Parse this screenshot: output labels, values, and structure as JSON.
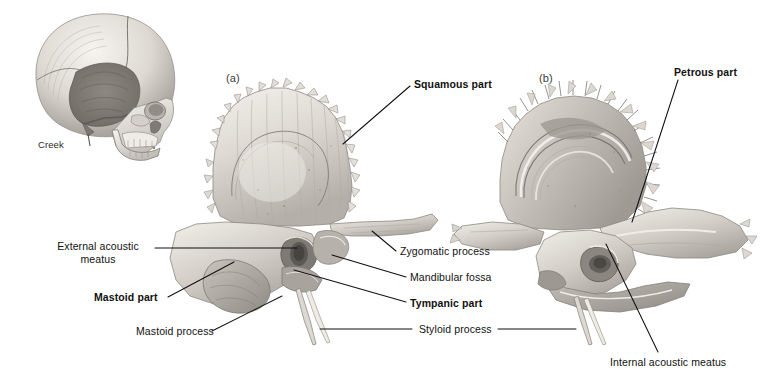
{
  "figure": {
    "kind": "anatomical-illustration",
    "background_color": "#ffffff",
    "ink_color": "#111111",
    "signature": "Creek"
  },
  "panels": [
    {
      "id": "a",
      "label": "(a)",
      "view": "lateral view of right temporal bone",
      "x": 232,
      "y": 74
    },
    {
      "id": "b",
      "label": "(b)",
      "view": "medial view of right temporal bone",
      "x": 545,
      "y": 74
    }
  ],
  "inset": {
    "name": "lateral skull orientation",
    "signature": "Creek",
    "signature_x": 38,
    "signature_y": 139
  },
  "labels": [
    {
      "id": "squamous-part",
      "text": "Squamous part",
      "bold": true,
      "x": 414,
      "y": 78,
      "align": "left",
      "lines": [
        [
          410,
          86,
          343,
          144
        ]
      ]
    },
    {
      "id": "petrous-part",
      "text": "Petrous part",
      "bold": true,
      "x": 674,
      "y": 66,
      "align": "left",
      "lines": [
        [
          678,
          80,
          632,
          222
        ]
      ]
    },
    {
      "id": "external-acoustic-meatus",
      "text": "External acoustic\nmeatus",
      "bold": false,
      "x": 46,
      "y": 240,
      "align": "left",
      "lines": [
        [
          155,
          248,
          297,
          248
        ]
      ]
    },
    {
      "id": "mastoid-part",
      "text": "Mastoid part",
      "bold": true,
      "x": 94,
      "y": 293,
      "align": "left",
      "lines": [
        [
          168,
          297,
          232,
          262
        ]
      ]
    },
    {
      "id": "mastoid-process",
      "text": "Mastoid process",
      "bold": false,
      "x": 136,
      "y": 330,
      "align": "left",
      "lines": [
        [
          210,
          331,
          280,
          296
        ]
      ]
    },
    {
      "id": "zygomatic-process",
      "text": "Zygomatic process",
      "bold": false,
      "x": 400,
      "y": 247,
      "align": "left",
      "lines": [
        [
          396,
          251,
          372,
          232
        ]
      ]
    },
    {
      "id": "mandibular-fossa",
      "text": "Mandibular fossa",
      "bold": false,
      "x": 410,
      "y": 274,
      "align": "left",
      "lines": [
        [
          406,
          277,
          330,
          254
        ]
      ]
    },
    {
      "id": "tympanic-part",
      "text": "Tympanic part",
      "bold": true,
      "x": 410,
      "y": 300,
      "align": "left",
      "lines": [
        [
          406,
          302,
          293,
          269
        ]
      ]
    },
    {
      "id": "styloid-process",
      "text": "Styloid process",
      "bold": false,
      "x": 417,
      "y": 325,
      "align": "left",
      "lines": [
        [
          414,
          329,
          322,
          329
        ],
        [
          414,
          329,
          322,
          329
        ]
      ]
    },
    {
      "id": "internal-acoustic-meatus",
      "text": "Internal acoustic meatus",
      "bold": false,
      "x": 610,
      "y": 356,
      "align": "left",
      "lines": [
        [
          606,
          244,
          658,
          352
        ]
      ]
    }
  ],
  "styloid_leaders": {
    "left_run": [
      318,
      329,
      160,
      329
    ],
    "right_run": [
      498,
      329,
      573,
      329
    ]
  },
  "anatomy_notes": {
    "panel_a_parts": [
      "Squamous part",
      "Zygomatic process",
      "Mandibular fossa",
      "External acoustic meatus",
      "Tympanic part",
      "Mastoid part",
      "Mastoid process",
      "Styloid process"
    ],
    "panel_b_parts": [
      "Petrous part",
      "Internal acoustic meatus",
      "Styloid process"
    ]
  }
}
